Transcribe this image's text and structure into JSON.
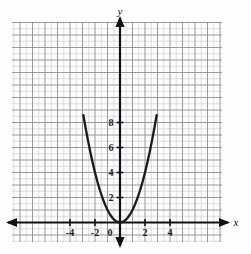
{
  "figure": {
    "kind": "coordinate-plane-graph",
    "background_color": "#fdfdfd",
    "axis_color": "#111111",
    "curve_color": "#1a1a1a",
    "major_grid_color": "#8f8f96",
    "minor_grid_color": "#c9c9d0"
  },
  "axes": {
    "x_axis_label": "x",
    "y_axis_label": "y",
    "origin_label": "0",
    "x_ticks": [
      {
        "value": -4,
        "label": "-4"
      },
      {
        "value": -2,
        "label": "-2"
      },
      {
        "value": 2,
        "label": "2"
      },
      {
        "value": 4,
        "label": "4"
      }
    ],
    "y_ticks": [
      {
        "value": 2,
        "label": "2"
      },
      {
        "value": 4,
        "label": "4"
      },
      {
        "value": 6,
        "label": "6"
      },
      {
        "value": 8,
        "label": "8"
      }
    ]
  },
  "chart_data": {
    "type": "line",
    "title": "",
    "xlabel": "x",
    "ylabel": "y",
    "xlim": [
      -4.4,
      4.4
    ],
    "ylim": [
      -1.4,
      8.6
    ],
    "grid": true,
    "minor_grid_step": 0.5,
    "major_grid_step": 1,
    "tick_label_step": 2,
    "legend": "none",
    "series": [
      {
        "name": "y = x^2",
        "equation": "y = x^2",
        "x": [
          -2.93,
          -2.8,
          -2.6,
          -2.4,
          -2.2,
          -2.0,
          -1.8,
          -1.6,
          -1.4,
          -1.2,
          -1.0,
          -0.8,
          -0.6,
          -0.4,
          -0.2,
          0.0,
          0.2,
          0.4,
          0.6,
          0.8,
          1.0,
          1.2,
          1.4,
          1.6,
          1.8,
          2.0,
          2.2,
          2.4,
          2.6,
          2.8,
          2.93
        ],
        "y": [
          8.58,
          7.84,
          6.76,
          5.76,
          4.84,
          4.0,
          3.24,
          2.56,
          1.96,
          1.44,
          1.0,
          0.64,
          0.36,
          0.16,
          0.04,
          0.0,
          0.04,
          0.16,
          0.36,
          0.64,
          1.0,
          1.44,
          1.96,
          2.56,
          3.24,
          4.0,
          4.84,
          5.76,
          6.76,
          7.84,
          8.58
        ]
      }
    ],
    "annotations": [
      {
        "text": "vertex at origin",
        "x": 0,
        "y": 0
      }
    ]
  }
}
